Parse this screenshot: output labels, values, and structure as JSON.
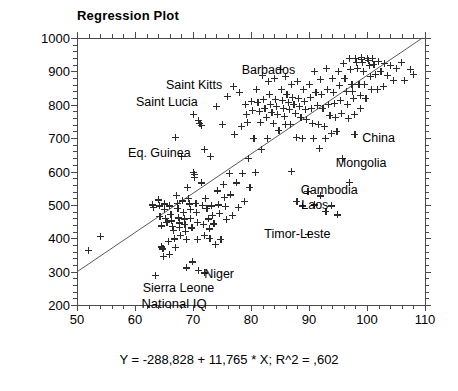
{
  "chart_data": {
    "type": "scatter",
    "title": "Regression Plot",
    "xlabel": "National IQ",
    "ylabel": "HDI-02",
    "xlim": [
      50,
      110
    ],
    "ylim": [
      200,
      1000
    ],
    "xticks": [
      50,
      60,
      70,
      80,
      90,
      100,
      110
    ],
    "yticks": [
      200,
      300,
      400,
      500,
      600,
      700,
      800,
      900,
      1000
    ],
    "xtick_labels": [
      "50",
      "60",
      "70",
      "80",
      "90",
      "100",
      "110"
    ],
    "ytick_labels": [
      "200",
      "300",
      "400",
      "500",
      "600",
      "700",
      "800",
      "900",
      "1000"
    ],
    "grid": false,
    "legend": null,
    "equation": "Y = -288,828 + 11,765 * X; R^2 = ,602",
    "fit": {
      "type": "linear",
      "intercept": -288.828,
      "slope": 11.765,
      "r_squared": 0.602,
      "x_start": 50,
      "y_start": 299.4,
      "x_end": 109.55,
      "y_end": 1000
    },
    "annotations": [
      {
        "label": "Barbados",
        "x": 83.0,
        "y": 905
      },
      {
        "label": "Saint Kitts",
        "x": 70.2,
        "y": 858
      },
      {
        "label": "Saint Lucia",
        "x": 65.5,
        "y": 808
      },
      {
        "label": "Eq. Guinea",
        "x": 64.2,
        "y": 655
      },
      {
        "label": "China",
        "x": 102.0,
        "y": 700
      },
      {
        "label": "Mongolia",
        "x": 99.0,
        "y": 625
      },
      {
        "label": "Cambodia",
        "x": 93.5,
        "y": 545
      },
      {
        "label": "Laos",
        "x": 91.0,
        "y": 500
      },
      {
        "label": "Timor-Leste",
        "x": 88.0,
        "y": 412
      },
      {
        "label": "Niger",
        "x": 74.5,
        "y": 292
      },
      {
        "label": "Sierra Leone",
        "x": 67.5,
        "y": 250
      }
    ],
    "points": [
      [
        52.0,
        363
      ],
      [
        54.0,
        406
      ],
      [
        63.0,
        500
      ],
      [
        63.2,
        492
      ],
      [
        63.5,
        288
      ],
      [
        64.0,
        515
      ],
      [
        64.2,
        497
      ],
      [
        64.3,
        465
      ],
      [
        64.5,
        437
      ],
      [
        64.6,
        374
      ],
      [
        64.8,
        368
      ],
      [
        64.9,
        345
      ],
      [
        65.0,
        503
      ],
      [
        65.1,
        487
      ],
      [
        65.3,
        460
      ],
      [
        65.5,
        447
      ],
      [
        65.7,
        391
      ],
      [
        65.9,
        352
      ],
      [
        66.0,
        497
      ],
      [
        66.2,
        471
      ],
      [
        66.3,
        452
      ],
      [
        66.5,
        436
      ],
      [
        66.6,
        424
      ],
      [
        66.8,
        398
      ],
      [
        66.9,
        372
      ],
      [
        67.0,
        703
      ],
      [
        67.1,
        528
      ],
      [
        67.3,
        505
      ],
      [
        67.4,
        489
      ],
      [
        67.5,
        461
      ],
      [
        67.6,
        446
      ],
      [
        67.7,
        433
      ],
      [
        67.8,
        408
      ],
      [
        68.0,
        645
      ],
      [
        68.2,
        512
      ],
      [
        68.4,
        478
      ],
      [
        68.5,
        458
      ],
      [
        68.6,
        442
      ],
      [
        68.7,
        421
      ],
      [
        68.8,
        397
      ],
      [
        68.9,
        311
      ],
      [
        69.0,
        553
      ],
      [
        69.2,
        519
      ],
      [
        69.4,
        503
      ],
      [
        69.5,
        487
      ],
      [
        69.6,
        459
      ],
      [
        69.8,
        431
      ],
      [
        69.9,
        329
      ],
      [
        70.0,
        770
      ],
      [
        70.1,
        597
      ],
      [
        70.2,
        591
      ],
      [
        70.3,
        583
      ],
      [
        70.5,
        504
      ],
      [
        70.6,
        478
      ],
      [
        70.7,
        448
      ],
      [
        70.8,
        396
      ],
      [
        70.9,
        304
      ],
      [
        71.0,
        752
      ],
      [
        71.2,
        743
      ],
      [
        71.4,
        737
      ],
      [
        71.5,
        566
      ],
      [
        71.6,
        499
      ],
      [
        71.8,
        441
      ],
      [
        71.9,
        408
      ],
      [
        71.95,
        296
      ],
      [
        72.0,
        665
      ],
      [
        72.2,
        520
      ],
      [
        72.4,
        490
      ],
      [
        72.6,
        458
      ],
      [
        72.8,
        428
      ],
      [
        72.9,
        399
      ],
      [
        73.0,
        646
      ],
      [
        73.2,
        497
      ],
      [
        73.4,
        468
      ],
      [
        73.6,
        443
      ],
      [
        73.8,
        382
      ],
      [
        74.0,
        795
      ],
      [
        74.2,
        542
      ],
      [
        74.4,
        500
      ],
      [
        74.6,
        474
      ],
      [
        74.8,
        397
      ],
      [
        75.0,
        740
      ],
      [
        75.2,
        561
      ],
      [
        75.4,
        523
      ],
      [
        75.6,
        496
      ],
      [
        75.8,
        456
      ],
      [
        76.0,
        824
      ],
      [
        76.3,
        594
      ],
      [
        76.5,
        530
      ],
      [
        76.8,
        469
      ],
      [
        77.0,
        855
      ],
      [
        77.2,
        710
      ],
      [
        77.5,
        566
      ],
      [
        77.8,
        492
      ],
      [
        78.0,
        838
      ],
      [
        78.3,
        736
      ],
      [
        78.5,
        595
      ],
      [
        78.8,
        510
      ],
      [
        79.0,
        800
      ],
      [
        79.2,
        772
      ],
      [
        79.4,
        746
      ],
      [
        79.6,
        640
      ],
      [
        79.8,
        553
      ],
      [
        80.0,
        810
      ],
      [
        80.2,
        784
      ],
      [
        80.5,
        700
      ],
      [
        80.8,
        597
      ],
      [
        81.0,
        846
      ],
      [
        81.2,
        808
      ],
      [
        81.4,
        780
      ],
      [
        81.6,
        748
      ],
      [
        81.8,
        665
      ],
      [
        82.0,
        888
      ],
      [
        82.2,
        815
      ],
      [
        82.4,
        790
      ],
      [
        82.6,
        763
      ],
      [
        82.8,
        700
      ],
      [
        83.0,
        870
      ],
      [
        83.2,
        832
      ],
      [
        83.4,
        800
      ],
      [
        83.6,
        778
      ],
      [
        83.8,
        745
      ],
      [
        84.0,
        880
      ],
      [
        84.2,
        815
      ],
      [
        84.4,
        795
      ],
      [
        84.6,
        770
      ],
      [
        84.8,
        722
      ],
      [
        85.0,
        905
      ],
      [
        85.2,
        845
      ],
      [
        85.4,
        812
      ],
      [
        85.6,
        790
      ],
      [
        85.8,
        765
      ],
      [
        85.9,
        742
      ],
      [
        86.0,
        885
      ],
      [
        86.2,
        830
      ],
      [
        86.4,
        808
      ],
      [
        86.6,
        785
      ],
      [
        86.8,
        740
      ],
      [
        86.9,
        600
      ],
      [
        87.0,
        862
      ],
      [
        87.2,
        822
      ],
      [
        87.4,
        800
      ],
      [
        87.6,
        775
      ],
      [
        87.8,
        703
      ],
      [
        87.9,
        510
      ],
      [
        88.0,
        870
      ],
      [
        88.2,
        818
      ],
      [
        88.4,
        795
      ],
      [
        88.6,
        763
      ],
      [
        88.8,
        700
      ],
      [
        88.9,
        497
      ],
      [
        89.0,
        845
      ],
      [
        89.2,
        810
      ],
      [
        89.4,
        787
      ],
      [
        89.6,
        755
      ],
      [
        89.8,
        540
      ],
      [
        89.9,
        412
      ],
      [
        90.0,
        860
      ],
      [
        90.2,
        822
      ],
      [
        90.4,
        790
      ],
      [
        90.6,
        745
      ],
      [
        90.8,
        700
      ],
      [
        90.9,
        500
      ],
      [
        91.0,
        900
      ],
      [
        91.2,
        838
      ],
      [
        91.4,
        798
      ],
      [
        91.6,
        742
      ],
      [
        91.8,
        668
      ],
      [
        91.9,
        527
      ],
      [
        92.0,
        875
      ],
      [
        92.2,
        830
      ],
      [
        92.4,
        790
      ],
      [
        92.6,
        735
      ],
      [
        92.8,
        700
      ],
      [
        92.9,
        480
      ],
      [
        93.0,
        908
      ],
      [
        93.2,
        845
      ],
      [
        93.4,
        800
      ],
      [
        93.6,
        768
      ],
      [
        93.8,
        715
      ],
      [
        93.9,
        497
      ],
      [
        94.0,
        880
      ],
      [
        94.2,
        838
      ],
      [
        94.4,
        805
      ],
      [
        94.6,
        762
      ],
      [
        94.8,
        720
      ],
      [
        94.9,
        470
      ],
      [
        95.0,
        900
      ],
      [
        95.2,
        858
      ],
      [
        95.4,
        812
      ],
      [
        95.6,
        775
      ],
      [
        95.8,
        640
      ],
      [
        96.0,
        925
      ],
      [
        96.2,
        880
      ],
      [
        96.4,
        840
      ],
      [
        96.6,
        800
      ],
      [
        96.8,
        760
      ],
      [
        96.9,
        568
      ],
      [
        97.0,
        940
      ],
      [
        97.2,
        905
      ],
      [
        97.4,
        862
      ],
      [
        97.5,
        840
      ],
      [
        97.6,
        818
      ],
      [
        97.8,
        770
      ],
      [
        97.9,
        712
      ],
      [
        98.0,
        938
      ],
      [
        98.2,
        928
      ],
      [
        98.4,
        910
      ],
      [
        98.6,
        862
      ],
      [
        98.8,
        828
      ],
      [
        98.9,
        790
      ],
      [
        99.0,
        942
      ],
      [
        99.1,
        935
      ],
      [
        99.2,
        928
      ],
      [
        99.4,
        900
      ],
      [
        99.6,
        862
      ],
      [
        99.8,
        818
      ],
      [
        100.0,
        940
      ],
      [
        100.2,
        932
      ],
      [
        100.4,
        918
      ],
      [
        100.6,
        885
      ],
      [
        100.8,
        845
      ],
      [
        101.0,
        938
      ],
      [
        101.2,
        922
      ],
      [
        101.5,
        890
      ],
      [
        101.8,
        845
      ],
      [
        102.0,
        930
      ],
      [
        102.4,
        900
      ],
      [
        102.8,
        855
      ],
      [
        103.0,
        925
      ],
      [
        103.5,
        888
      ],
      [
        104.0,
        918
      ],
      [
        104.5,
        872
      ],
      [
        105.0,
        910
      ],
      [
        106.0,
        928
      ],
      [
        106.5,
        872
      ],
      [
        107.5,
        905
      ],
      [
        108.0,
        890
      ]
    ]
  }
}
